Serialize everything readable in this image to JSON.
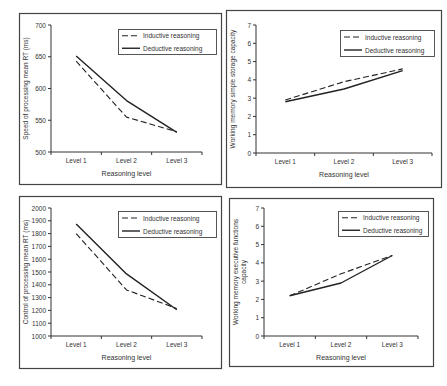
{
  "figure": {
    "colors": {
      "line": "#222222",
      "axis": "#333333",
      "border": "#444444",
      "text": "#333333",
      "background": "#ffffff"
    }
  },
  "chart_data": [
    {
      "id": "speed",
      "type": "line",
      "title": "",
      "xlabel": "Reasoning level",
      "ylabel": "Speed of processing mean RT (ms)",
      "categories": [
        "Level 1",
        "Level 2",
        "Level 3"
      ],
      "ylim": [
        500,
        700
      ],
      "yticks": [
        500,
        550,
        600,
        650,
        700
      ],
      "grid": false,
      "legend_position": "top-right",
      "series": [
        {
          "name": "Inductive reasoning",
          "style": "dashed",
          "values": [
            643,
            555,
            532
          ]
        },
        {
          "name": "Deductive reasoning",
          "style": "solid",
          "values": [
            651,
            581,
            531
          ]
        }
      ]
    },
    {
      "id": "storage",
      "type": "line",
      "title": "",
      "xlabel": "Reasoning level",
      "ylabel": "Working memory simple storage capacity",
      "categories": [
        "Level 1",
        "Level 2",
        "Level 3"
      ],
      "ylim": [
        0,
        7
      ],
      "yticks": [
        0,
        1,
        2,
        3,
        4,
        5,
        6,
        7
      ],
      "grid": false,
      "legend_position": "top-right",
      "series": [
        {
          "name": "Inductive reasoning",
          "style": "dashed",
          "values": [
            2.9,
            3.9,
            4.6
          ]
        },
        {
          "name": "Deductive reasoning",
          "style": "solid",
          "values": [
            2.8,
            3.5,
            4.5
          ]
        }
      ]
    },
    {
      "id": "control",
      "type": "line",
      "title": "",
      "xlabel": "Reasoning level",
      "ylabel": "Control of processing mean RT (ms)",
      "categories": [
        "Level 1",
        "Level 2",
        "Level 3"
      ],
      "ylim": [
        1000,
        2000
      ],
      "yticks": [
        1000,
        1100,
        1200,
        1300,
        1400,
        1500,
        1600,
        1700,
        1800,
        1900,
        2000
      ],
      "grid": false,
      "legend_position": "top-right",
      "series": [
        {
          "name": "Inductive reasoning",
          "style": "dashed",
          "values": [
            1800,
            1360,
            1215
          ]
        },
        {
          "name": "Deductive reasoning",
          "style": "solid",
          "values": [
            1875,
            1485,
            1205
          ]
        }
      ]
    },
    {
      "id": "executive",
      "type": "line",
      "title": "",
      "xlabel": "Reasoning level",
      "ylabel": "Working memory executive functions capacity",
      "ylabel_lines": [
        "Working memory executive functions",
        "capacity"
      ],
      "categories": [
        "Level 1",
        "Level 2",
        "Level 3"
      ],
      "ylim": [
        0,
        7
      ],
      "yticks": [
        0,
        1,
        2,
        3,
        4,
        5,
        6,
        7
      ],
      "grid": false,
      "legend_position": "top-right",
      "series": [
        {
          "name": "Inductive reasoning",
          "style": "dashed",
          "values": [
            2.2,
            3.4,
            4.4
          ]
        },
        {
          "name": "Deductive reasoning",
          "style": "solid",
          "values": [
            2.2,
            2.9,
            4.4
          ]
        }
      ]
    }
  ]
}
